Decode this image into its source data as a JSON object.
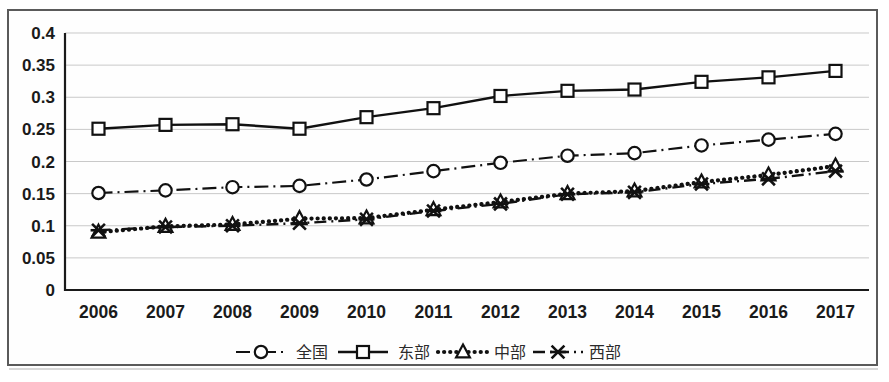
{
  "chart_data": {
    "type": "line",
    "title": "",
    "subtitle": "",
    "xlabel": "",
    "ylabel": "",
    "categories": [
      "2006",
      "2007",
      "2008",
      "2009",
      "2010",
      "2011",
      "2012",
      "2013",
      "2014",
      "2015",
      "2016",
      "2017"
    ],
    "ylim": [
      0,
      0.4
    ],
    "yticks": [
      "0",
      "0.05",
      "0.1",
      "0.15",
      "0.2",
      "0.25",
      "0.3",
      "0.35",
      "0.4"
    ],
    "ytick_values": [
      0,
      0.05,
      0.1,
      0.15,
      0.2,
      0.25,
      0.3,
      0.35,
      0.4
    ],
    "grid": true,
    "grid_axis": "y",
    "legend_position": "bottom-center",
    "series": [
      {
        "name": "全国",
        "marker": "circle",
        "line_style": "dash-dot",
        "color": "#111111",
        "values": [
          0.151,
          0.155,
          0.16,
          0.162,
          0.172,
          0.185,
          0.198,
          0.209,
          0.213,
          0.225,
          0.234,
          0.243
        ]
      },
      {
        "name": "东部",
        "marker": "square",
        "line_style": "solid",
        "color": "#111111",
        "values": [
          0.251,
          0.257,
          0.258,
          0.251,
          0.269,
          0.283,
          0.302,
          0.31,
          0.312,
          0.324,
          0.331,
          0.341
        ]
      },
      {
        "name": "中部",
        "marker": "triangle",
        "line_style": "dotted",
        "color": "#111111",
        "values": [
          0.09,
          0.099,
          0.102,
          0.111,
          0.112,
          0.125,
          0.137,
          0.15,
          0.154,
          0.168,
          0.179,
          0.193
        ]
      },
      {
        "name": "西部",
        "marker": "x",
        "line_style": "dashed",
        "color": "#111111",
        "values": [
          0.093,
          0.098,
          0.1,
          0.104,
          0.11,
          0.123,
          0.134,
          0.149,
          0.152,
          0.165,
          0.173,
          0.185
        ]
      }
    ]
  },
  "legend": {
    "entries": [
      {
        "label": "全国"
      },
      {
        "label": "东部"
      },
      {
        "label": "中部"
      },
      {
        "label": "西部"
      }
    ]
  }
}
